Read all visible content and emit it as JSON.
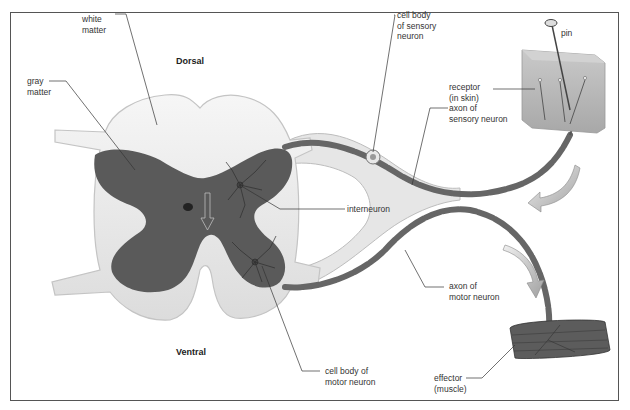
{
  "diagram": {
    "orientation": {
      "top": "Dorsal",
      "bottom": "Ventral"
    },
    "labels": {
      "white_matter": "white\nmatter",
      "gray_matter": "gray\nmatter",
      "dorsal": "Dorsal",
      "ventral": "Ventral",
      "sensory_cell_body": "cell body\nof sensory\nneuron",
      "receptor": "receptor\n(in skin)",
      "pin": "pin",
      "sensory_axon": "axon of\nsensory neuron",
      "interneuron": "interneuron",
      "motor_axon": "axon of\nmotor neuron",
      "motor_cell_body": "cell body of\nmotor neuron",
      "effector": "effector\n(muscle)"
    },
    "colors": {
      "gray_matter": "#5a5a5a",
      "white_matter": "#efefef",
      "axon": "#6b6b6b",
      "arrow": "#c8c8c8",
      "frame": "#555555",
      "skin": "#b5b5b5",
      "muscle": "#5c5c5c"
    }
  }
}
